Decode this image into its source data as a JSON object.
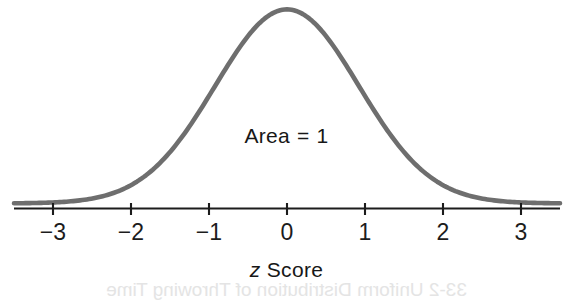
{
  "figure": {
    "background_color": "#ffffff",
    "curve_color": "#6e6e6e",
    "axis_color": "#1c1c1c",
    "text_color": "#171717",
    "annotation": {
      "prefix": "Area",
      "operator": "=",
      "value": "1",
      "full": "Area = 1"
    },
    "axis_title_prefix": "z",
    "axis_title_suffix": "Score",
    "axis_title_full": "z Score",
    "bleedthrough_text": "33-2  Uniform Distribution of Throwing Time"
  },
  "chart_data": {
    "type": "line",
    "title": "",
    "subtitle": "",
    "xlabel": "z Score",
    "ylabel": "",
    "xlim": [
      -3.5,
      3.5
    ],
    "ylim": [
      0,
      1.02
    ],
    "grid": false,
    "legend": null,
    "xticks": [
      -3,
      -2,
      -1,
      0,
      1,
      2,
      3
    ],
    "xticklabels": [
      "−3",
      "−2",
      "−1",
      "0",
      "1",
      "2",
      "3"
    ],
    "yticks": [],
    "yticklabels": [],
    "annotations": [
      {
        "text": "Area = 1",
        "x": 0,
        "y": 0.37
      }
    ],
    "series": [
      {
        "name": "Standard normal density",
        "distribution": "normal",
        "mean": 0,
        "sigma": 0.92,
        "peak_value": 1.0,
        "x": [
          -3.5,
          -3.25,
          -3,
          -2.75,
          -2.5,
          -2.25,
          -2,
          -1.75,
          -1.5,
          -1.25,
          -1,
          -0.75,
          -0.5,
          -0.25,
          0,
          0.25,
          0.5,
          0.75,
          1,
          1.25,
          1.5,
          1.75,
          2,
          2.25,
          2.5,
          2.75,
          3,
          3.25,
          3.5
        ],
        "values": [
          0.024,
          0.043,
          0.005,
          0.112,
          0.175,
          0.256,
          0.351,
          0.454,
          0.556,
          0.651,
          0.732,
          0.845,
          0.862,
          0.964,
          1.0,
          0.964,
          0.862,
          0.845,
          0.732,
          0.651,
          0.556,
          0.454,
          0.351,
          0.256,
          0.175,
          0.112,
          0.005,
          0.043,
          0.024
        ]
      }
    ]
  }
}
